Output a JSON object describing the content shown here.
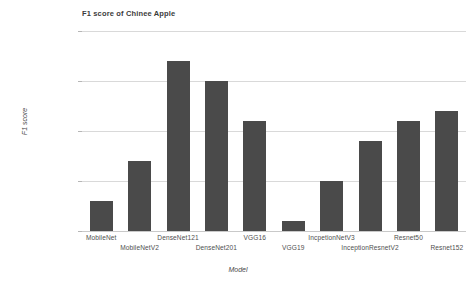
{
  "chart_data": {
    "type": "bar",
    "title": "F1 score of Chinee Apple",
    "xlabel": "Model",
    "ylabel": "F1 score",
    "categories": [
      "MobileNet",
      "MobileNetV2",
      "DenseNet121",
      "DenseNet201",
      "VGG16",
      "VGG19",
      "IncpetionNetV3",
      "InceptionResnetV2",
      "Resnet50",
      "Resnet152"
    ],
    "values": [
      0.78,
      0.82,
      0.92,
      0.9,
      0.86,
      0.76,
      0.8,
      0.84,
      0.86,
      0.87
    ],
    "ylim": [
      0.75,
      0.95
    ],
    "yticks": [
      0.75,
      0.8,
      0.85,
      0.9,
      0.95
    ],
    "ytick_labels": [
      "0.75",
      "0.8",
      "0.85",
      "0.9",
      "0.95"
    ],
    "grid": true,
    "legend": false,
    "bar_color": "#4a4a4a",
    "grid_color": "#d9d9d9",
    "background": "#ffffff"
  }
}
